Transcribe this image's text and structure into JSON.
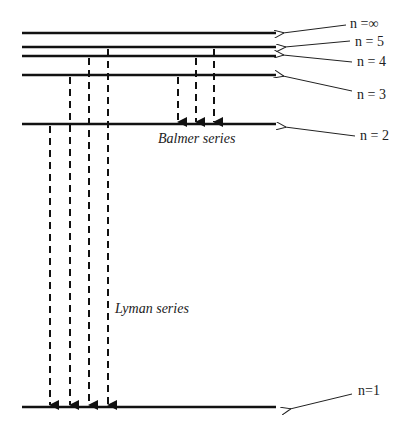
{
  "diagram": {
    "type": "energy-level-diagram",
    "levels": [
      {
        "id": "n_inf",
        "label": "n =∞",
        "y": 33
      },
      {
        "id": "n5",
        "label": "n = 5",
        "y": 47
      },
      {
        "id": "n4",
        "label": "n = 4",
        "y": 56
      },
      {
        "id": "n3",
        "label": "n = 3",
        "y": 75
      },
      {
        "id": "n2",
        "label": "n = 2",
        "y": 124
      },
      {
        "id": "n1",
        "label": "n=1",
        "y": 407
      }
    ],
    "series": [
      {
        "name": "Balmer series",
        "final_level": "n = 2",
        "transitions": [
          {
            "from": "n = 3",
            "to": "n = 2"
          },
          {
            "from": "n = 4",
            "to": "n = 2"
          },
          {
            "from": "n = 5",
            "to": "n = 2"
          }
        ]
      },
      {
        "name": "Lyman series",
        "final_level": "n=1",
        "transitions": [
          {
            "from": "n = 2",
            "to": "n=1"
          },
          {
            "from": "n = 3",
            "to": "n=1"
          },
          {
            "from": "n = 4",
            "to": "n=1"
          },
          {
            "from": "n = 5",
            "to": "n=1"
          }
        ]
      }
    ],
    "labels": {
      "n_inf": "n =∞",
      "n5": "n = 5",
      "n4": "n = 4",
      "n3": "n = 3",
      "n2": "n = 2",
      "n1": "n=1",
      "balmer": "Balmer series",
      "lyman": "Lyman series"
    },
    "colors": {
      "line": "#111111",
      "background": "#ffffff"
    }
  }
}
